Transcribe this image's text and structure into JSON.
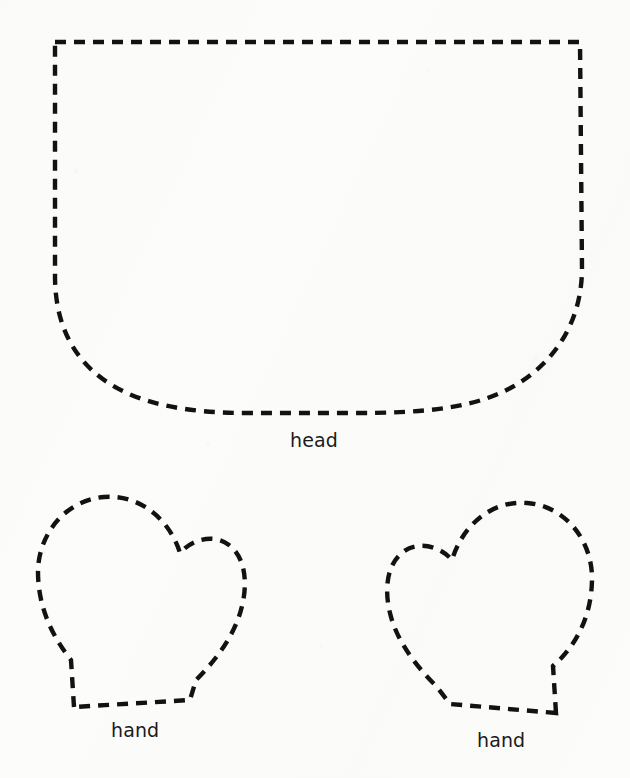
{
  "sheet": {
    "background_color": "#fcfcfb",
    "ink_color": "#121212",
    "width": 630,
    "height": 778,
    "kind": "sewing-pattern-cutting-template"
  },
  "line_style": {
    "stroke_color": "#121212",
    "stroke_width": 4.4,
    "dash_length": 11,
    "gap_length": 8
  },
  "pieces": [
    {
      "id": "head",
      "label": "head",
      "label_x": 290,
      "label_y": 430,
      "shape": "rounded-bucket",
      "bounds": {
        "x": 52,
        "y": 40,
        "width": 532,
        "height": 373
      },
      "path": "M 55 42 L 580 42 L 582 268 C 582 316 560 357 519 383 C 478 409 424 413 352 413 L 248 413 C 186 413 140 404 107 382 C 74 360 55 325 55 276 Z"
    },
    {
      "id": "hand-left",
      "label": "hand",
      "label_x": 111,
      "label_y": 720,
      "shape": "mitten-thumb-right",
      "bounds": {
        "x": 36,
        "y": 494,
        "width": 212,
        "height": 215
      },
      "path": "M 74 707 L 71 660 C 55 640 38 610 38 572 C 38 535 65 500 104 497 C 140 494 170 520 180 553 C 193 538 215 534 229 545 C 245 557 248 582 242 606 C 236 632 219 657 196 680 L 190 700 Z"
    },
    {
      "id": "hand-right",
      "label": "hand",
      "label_x": 477,
      "label_y": 730,
      "shape": "mitten-thumb-left",
      "bounds": {
        "x": 384,
        "y": 501,
        "width": 210,
        "height": 214
      },
      "path": "M 556 713 L 553 666 C 576 646 592 616 592 578 C 592 541 566 506 527 503 C 490 500 462 527 452 560 C 439 545 417 541 403 552 C 387 564 384 589 390 613 C 396 639 414 664 437 687 L 450 704 Z"
    }
  ],
  "labels": {
    "head": "head",
    "hand_left": "hand",
    "hand_right": "hand"
  }
}
